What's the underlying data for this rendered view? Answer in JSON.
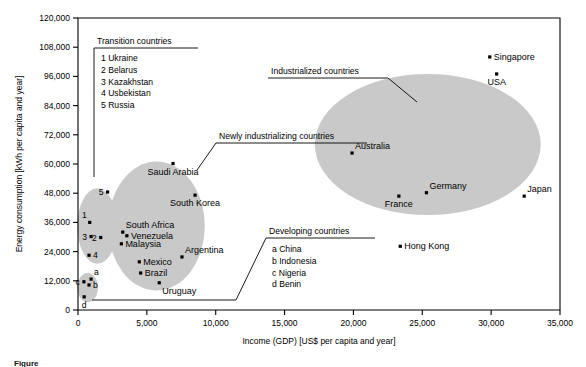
{
  "chart_data": {
    "type": "scatter",
    "title": "",
    "xlabel": "Income (GDP) [US$ per capita and year]",
    "ylabel": "Energy consumption [kWh per capita and year]",
    "xlim": [
      0,
      35000
    ],
    "ylim": [
      0,
      120000
    ],
    "xticks": [
      0,
      5000,
      10000,
      15000,
      20000,
      25000,
      30000,
      35000
    ],
    "xticklabels": [
      "0",
      "5,000",
      "10,000",
      "15,000",
      "20,000",
      "25,000",
      "30,000",
      "35,000"
    ],
    "yticks": [
      0,
      12000,
      24000,
      36000,
      48000,
      60000,
      72000,
      84000,
      96000,
      108000,
      120000
    ],
    "yticklabels": [
      "0",
      "12,000",
      "24,000",
      "36,000",
      "48,000",
      "60,000",
      "72,000",
      "84,000",
      "96,000",
      "108,000",
      "120,000"
    ],
    "grid": false,
    "legend_position": "inline-annotations",
    "points": [
      {
        "label": "5",
        "name": "Russia",
        "x": 2150,
        "y": 48500,
        "label_pos": "left",
        "group": "transition"
      },
      {
        "label": "1",
        "name": "Ukraine",
        "x": 850,
        "y": 36000,
        "label_pos": "above-left",
        "group": "transition"
      },
      {
        "label": "3",
        "name": "Kazakhstan",
        "x": 950,
        "y": 30200,
        "label_pos": "left",
        "group": "transition"
      },
      {
        "label": "2",
        "name": "Belarus",
        "x": 1650,
        "y": 29800,
        "label_pos": "left",
        "group": "transition"
      },
      {
        "label": "4",
        "name": "Usbekistan",
        "x": 800,
        "y": 22500,
        "label_pos": "right",
        "group": "transition"
      },
      {
        "label": "Saudi Arabia",
        "name": "Saudi Arabia",
        "x": 6900,
        "y": 60200,
        "label_pos": "below",
        "group": "newly"
      },
      {
        "label": "South Korea",
        "name": "South Korea",
        "x": 8500,
        "y": 47200,
        "label_pos": "below",
        "group": "newly"
      },
      {
        "label": "South Africa",
        "name": "South Africa",
        "x": 3250,
        "y": 32000,
        "label_pos": "above-right",
        "group": "newly"
      },
      {
        "label": "Venezuela",
        "name": "Venezuela",
        "x": 3550,
        "y": 30500,
        "label_pos": "right",
        "group": "newly"
      },
      {
        "label": "Malaysia",
        "name": "Malaysia",
        "x": 3150,
        "y": 27200,
        "label_pos": "right",
        "group": "newly"
      },
      {
        "label": "Argentina",
        "name": "Argentina",
        "x": 7550,
        "y": 21800,
        "label_pos": "above-right",
        "group": "newly"
      },
      {
        "label": "Mexico",
        "name": "Mexico",
        "x": 4450,
        "y": 19800,
        "label_pos": "right",
        "group": "newly"
      },
      {
        "label": "Brazil",
        "name": "Brazil",
        "x": 4550,
        "y": 15200,
        "label_pos": "right",
        "group": "newly"
      },
      {
        "label": "Uruguay",
        "name": "Uruguay",
        "x": 5900,
        "y": 11200,
        "label_pos": "below-right",
        "group": "newly"
      },
      {
        "label": "Singapore",
        "name": "Singapore",
        "x": 29900,
        "y": 104000,
        "label_pos": "right",
        "group": "industrialized"
      },
      {
        "label": "USA",
        "name": "USA",
        "x": 30400,
        "y": 97000,
        "label_pos": "below",
        "group": "industrialized"
      },
      {
        "label": "Australia",
        "name": "Australia",
        "x": 19900,
        "y": 64500,
        "label_pos": "above-right",
        "group": "industrialized"
      },
      {
        "label": "Germany",
        "name": "Germany",
        "x": 25300,
        "y": 48200,
        "label_pos": "above-right",
        "group": "industrialized"
      },
      {
        "label": "France",
        "name": "France",
        "x": 23300,
        "y": 46800,
        "label_pos": "below",
        "group": "industrialized"
      },
      {
        "label": "Japan",
        "name": "Japan",
        "x": 32400,
        "y": 46800,
        "label_pos": "above-right",
        "group": "industrialized"
      },
      {
        "label": "Hong Kong",
        "name": "Hong Kong",
        "x": 23400,
        "y": 26200,
        "label_pos": "right",
        "group": "industrialized"
      },
      {
        "label": "a",
        "name": "China",
        "x": 950,
        "y": 12700,
        "label_pos": "above-right",
        "group": "developing"
      },
      {
        "label": "b",
        "name": "Indonesia",
        "x": 800,
        "y": 10300,
        "label_pos": "right",
        "group": "developing"
      },
      {
        "label": "c",
        "name": "Nigeria",
        "x": 430,
        "y": 11600,
        "label_pos": "left",
        "group": "developing"
      },
      {
        "label": "d",
        "name": "Benin",
        "x": 450,
        "y": 5400,
        "label_pos": "below",
        "group": "developing"
      }
    ],
    "clusters": [
      {
        "id": "transition",
        "label": "Transition countries",
        "cx": 1400,
        "cy": 34500,
        "rx": 1450,
        "ry": 15500
      },
      {
        "id": "newly",
        "label": "Newly industrializing countries",
        "cx": 5700,
        "cy": 34500,
        "rx": 3500,
        "ry": 26500
      },
      {
        "id": "industrialized",
        "label": "Industrialized countries",
        "cx": 25400,
        "cy": 68000,
        "rx": 8200,
        "ry": 29000
      },
      {
        "id": "developing",
        "label": "Developing countries",
        "cx": 700,
        "cy": 9200,
        "rx": 750,
        "ry": 6000
      }
    ]
  },
  "annotations": {
    "transition": {
      "title": "Transition countries",
      "items": [
        "1 Ukraine",
        "2 Belarus",
        "3 Kazakhstan",
        "4 Usbekistan",
        "5 Russia"
      ]
    },
    "industrialized": {
      "title": "Industrialized countries",
      "items": []
    },
    "newly": {
      "title": "Newly industrializing countries",
      "items": []
    },
    "developing": {
      "title": "Developing countries",
      "items": [
        "a China",
        "b Indonesia",
        "c Nigeria",
        "d Benin"
      ]
    }
  },
  "caption": {
    "text": "Figure"
  },
  "colors": {
    "blob": "#c9c9c9",
    "axis": "#000000",
    "dot": "#000000",
    "background": "#ffffff"
  }
}
